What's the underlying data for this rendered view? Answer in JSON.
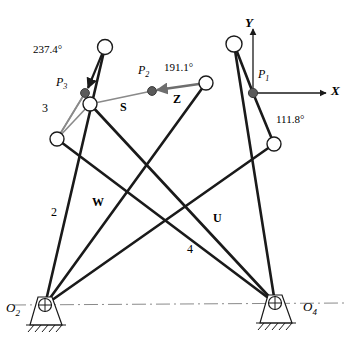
{
  "figure": {
    "width": 352,
    "height": 341,
    "background": "#ffffff",
    "stroke_dark": "#1a1a1a",
    "stroke_gray": "#8a8a8a",
    "joint_fill": "#ffffff",
    "precision_point_fill": "#5a5a5a"
  },
  "axes": {
    "x_label": "X",
    "y_label": "Y",
    "origin_label": "P",
    "origin_sub": "1",
    "origin_x": 253,
    "origin_y": 93,
    "x_tip_x": 330,
    "y_tip_y": 25
  },
  "pivots": [
    {
      "name": "O2",
      "label": "O",
      "sub": "2",
      "x": 45,
      "y": 305
    },
    {
      "name": "O4",
      "label": "O",
      "sub": "4",
      "x": 275,
      "y": 303
    }
  ],
  "joints": [
    {
      "name": "joint-top-left",
      "x": 105,
      "y": 47
    },
    {
      "name": "joint-mid-left",
      "x": 90,
      "y": 104
    },
    {
      "name": "joint-lower-left",
      "x": 57,
      "y": 139
    },
    {
      "name": "joint-coupler-right",
      "x": 206,
      "y": 83
    },
    {
      "name": "joint-top-right",
      "x": 234,
      "y": 44
    },
    {
      "name": "joint-lower-right",
      "x": 274,
      "y": 144
    }
  ],
  "precision_points": [
    {
      "name": "P1",
      "label": "P",
      "sub": "1",
      "x": 253,
      "y": 93,
      "label_x": 258,
      "label_y": 74
    },
    {
      "name": "P2",
      "label": "P",
      "sub": "2",
      "x": 152,
      "y": 91,
      "label_x": 138,
      "label_y": 70
    },
    {
      "name": "P3",
      "label": "P",
      "sub": "3",
      "x": 85,
      "y": 93,
      "label_x": 59,
      "label_y": 82
    }
  ],
  "angle_labels": [
    {
      "name": "angle-237",
      "text": "237.4°",
      "x": 33,
      "y": 50
    },
    {
      "name": "angle-191",
      "text": "191.1°",
      "x": 164,
      "y": 68
    },
    {
      "name": "angle-112",
      "text": "111.8°",
      "x": 276,
      "y": 120
    }
  ],
  "vector_labels": [
    {
      "name": "vector-S",
      "text": "S",
      "x": 120,
      "y": 100
    },
    {
      "name": "vector-Z",
      "text": "Z",
      "x": 173,
      "y": 97
    },
    {
      "name": "vector-W",
      "text": "W",
      "x": 92,
      "y": 201
    },
    {
      "name": "vector-U",
      "text": "U",
      "x": 213,
      "y": 216
    }
  ],
  "link_labels": [
    {
      "name": "link-2",
      "text": "2",
      "x": 51,
      "y": 211
    },
    {
      "name": "link-3",
      "text": "3",
      "x": 42,
      "y": 107
    },
    {
      "name": "link-4",
      "text": "4",
      "x": 187,
      "y": 248
    }
  ],
  "ground_line": {
    "name": "ground-centerline",
    "x1": 12,
    "y1": 305,
    "x2": 345,
    "y2": 303,
    "style": "dash-dot",
    "color": "#8a8a8a"
  },
  "links_dark": [
    {
      "name": "link-O2-to-joint-top-left",
      "x1": 45,
      "y1": 305,
      "x2": 105,
      "y2": 47
    },
    {
      "name": "link-O2-to-joint-coupler-right",
      "x1": 45,
      "y1": 305,
      "x2": 206,
      "y2": 83
    },
    {
      "name": "link-O2-to-joint-lower-right",
      "x1": 45,
      "y1": 305,
      "x2": 274,
      "y2": 144
    },
    {
      "name": "link-O4-to-joint-top-right",
      "x1": 275,
      "y1": 303,
      "x2": 234,
      "y2": 44
    },
    {
      "name": "link-O4-to-joint-lower-left",
      "x1": 275,
      "y1": 303,
      "x2": 57,
      "y2": 139
    },
    {
      "name": "link-O4-to-joint-mid-left",
      "x1": 275,
      "y1": 303,
      "x2": 90,
      "y2": 104
    },
    {
      "name": "link-top-right-to-P1",
      "x1": 234,
      "y1": 44,
      "x2": 253,
      "y2": 93
    },
    {
      "name": "link-P1-to-lower-right",
      "x1": 253,
      "y1": 93,
      "x2": 274,
      "y2": 144
    },
    {
      "name": "link-top-left-to-P3",
      "x1": 105,
      "y1": 47,
      "x2": 85,
      "y2": 93
    },
    {
      "name": "link-coupler-right-to-P2",
      "x1": 206,
      "y1": 83,
      "x2": 152,
      "y2": 91
    }
  ],
  "links_gray": [
    {
      "name": "coupler-P2-to-mid-left",
      "x1": 152,
      "y1": 91,
      "x2": 90,
      "y2": 104
    },
    {
      "name": "coupler-P3-to-lower-left",
      "x1": 85,
      "y1": 93,
      "x2": 57,
      "y2": 139
    },
    {
      "name": "coupler-mid-left-to-lower-left",
      "x1": 90,
      "y1": 104,
      "x2": 57,
      "y2": 139
    }
  ]
}
